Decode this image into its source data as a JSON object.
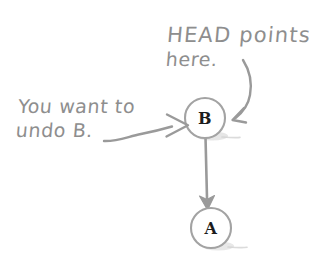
{
  "diagram": {
    "background_color": "#ffffff",
    "ink_color": "#8e8e8e",
    "node_text_color": "#1c1c1c",
    "annotations": [
      {
        "id": "head-annotation",
        "line1": "HEAD points",
        "line2": "here.",
        "points_to": "node-b"
      },
      {
        "id": "undo-annotation",
        "line1": "You want to",
        "line2": "undo B.",
        "points_to": "node-b"
      }
    ],
    "nodes": [
      {
        "id": "node-b",
        "label": "B",
        "cx": 205,
        "cy": 118,
        "r": 20
      },
      {
        "id": "node-a",
        "label": "A",
        "cx": 211,
        "cy": 228,
        "r": 20
      }
    ],
    "edges": [
      {
        "from": "node-b",
        "to": "node-a",
        "style": "straight-arrow-down"
      }
    ]
  }
}
